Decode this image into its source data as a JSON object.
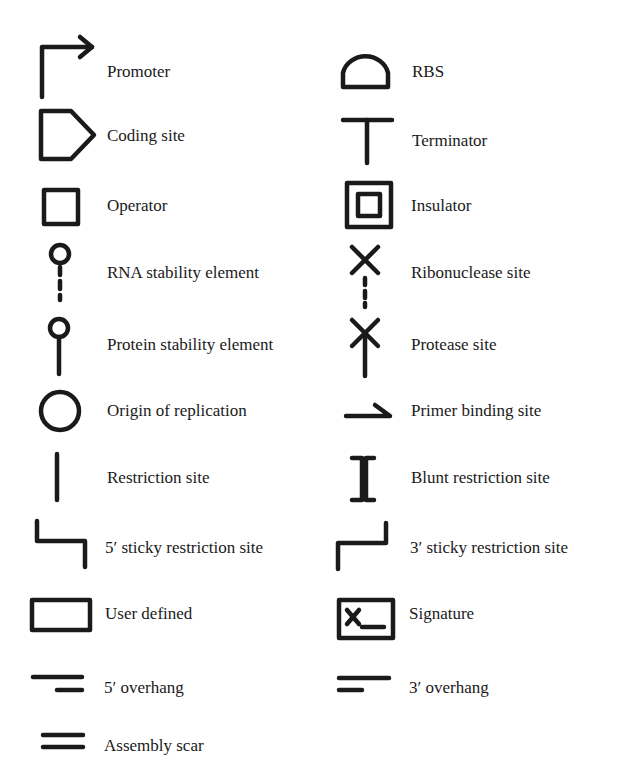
{
  "legend": {
    "left": [
      {
        "label": "Promoter",
        "icon": "promoter-icon"
      },
      {
        "label": "Coding site",
        "icon": "coding-site-icon"
      },
      {
        "label": "Operator",
        "icon": "operator-icon"
      },
      {
        "label": "RNA stability element",
        "icon": "rna-stability-element-icon"
      },
      {
        "label": "Protein stability element",
        "icon": "protein-stability-element-icon"
      },
      {
        "label": "Origin of replication",
        "icon": "origin-of-replication-icon"
      },
      {
        "label": "Restriction site",
        "icon": "restriction-site-icon"
      },
      {
        "label": "5′ sticky restriction site",
        "icon": "five-prime-sticky-restriction-site-icon"
      },
      {
        "label": "User defined",
        "icon": "user-defined-icon"
      },
      {
        "label": "5′ overhang",
        "icon": "five-prime-overhang-icon"
      },
      {
        "label": "Assembly scar",
        "icon": "assembly-scar-icon"
      }
    ],
    "right": [
      {
        "label": "RBS",
        "icon": "rbs-icon"
      },
      {
        "label": "Terminator",
        "icon": "terminator-icon"
      },
      {
        "label": "Insulator",
        "icon": "insulator-icon"
      },
      {
        "label": "Ribonuclease site",
        "icon": "ribonuclease-site-icon"
      },
      {
        "label": "Protease site",
        "icon": "protease-site-icon"
      },
      {
        "label": "Primer binding site",
        "icon": "primer-binding-site-icon"
      },
      {
        "label": "Blunt restriction site",
        "icon": "blunt-restriction-site-icon"
      },
      {
        "label": "3′ sticky restriction site",
        "icon": "three-prime-sticky-restriction-site-icon"
      },
      {
        "label": "Signature",
        "icon": "signature-icon"
      },
      {
        "label": "3′ overhang",
        "icon": "three-prime-overhang-icon"
      }
    ]
  },
  "colors": {
    "ink": "#1a1a1a",
    "background": "#ffffff"
  }
}
